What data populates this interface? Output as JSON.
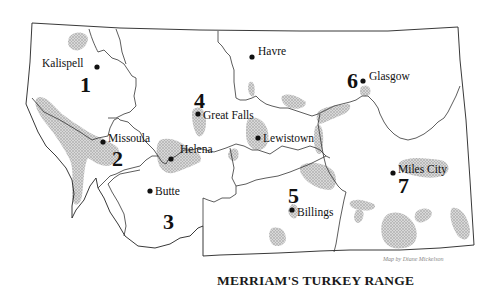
{
  "map": {
    "title": "MERRIAM'S TURKEY RANGE",
    "credit": "Map by Diane Mickelson",
    "colors": {
      "outline": "#222222",
      "range_fill": "#bdbdbd",
      "text": "#111111",
      "background": "#ffffff"
    },
    "cities": [
      {
        "name": "Kalispell",
        "x": 97,
        "y": 67
      },
      {
        "name": "Havre",
        "x": 252,
        "y": 57
      },
      {
        "name": "Glasgow",
        "x": 363,
        "y": 81
      },
      {
        "name": "Great Falls",
        "x": 198,
        "y": 114
      },
      {
        "name": "Missoula",
        "x": 103,
        "y": 142
      },
      {
        "name": "Helena",
        "x": 171,
        "y": 159
      },
      {
        "name": "Lewistown",
        "x": 258,
        "y": 138
      },
      {
        "name": "Butte",
        "x": 150,
        "y": 191
      },
      {
        "name": "Billings",
        "x": 292,
        "y": 210
      },
      {
        "name": "Miles City",
        "x": 393,
        "y": 173
      }
    ],
    "regions": [
      {
        "number": "1",
        "x": 80,
        "y": 92
      },
      {
        "number": "2",
        "x": 112,
        "y": 166
      },
      {
        "number": "3",
        "x": 163,
        "y": 229
      },
      {
        "number": "4",
        "x": 194,
        "y": 108
      },
      {
        "number": "5",
        "x": 288,
        "y": 203
      },
      {
        "number": "6",
        "x": 347,
        "y": 88
      },
      {
        "number": "7",
        "x": 398,
        "y": 193
      }
    ]
  }
}
